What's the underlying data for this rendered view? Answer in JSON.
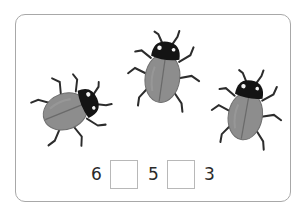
{
  "colors": {
    "card_border": "#a8a8a8",
    "beetle_body": "#8c8c8c",
    "beetle_head": "#111111",
    "text": "#2a2a2a",
    "box_border": "#b8b8b8"
  },
  "beetles": [
    {
      "name": "left",
      "count": 1
    },
    {
      "name": "middle",
      "count": 1
    },
    {
      "name": "right",
      "count": 1
    }
  ],
  "comparison": {
    "numbers": [
      "6",
      "5",
      "3"
    ],
    "blanks": [
      "",
      ""
    ]
  }
}
